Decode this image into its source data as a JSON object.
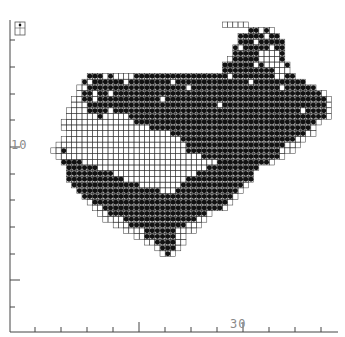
{
  "map": {
    "title": "",
    "type": "tetrad distribution map",
    "colors": {
      "background": "#ffffff",
      "grid": "#333333",
      "dot": "#111111",
      "axis": "#444444",
      "label": "#8a8a8a"
    },
    "cell_size": 5.2,
    "origin": {
      "x": 30,
      "y": 27
    },
    "axis": {
      "y_label": "10",
      "x_label": "30",
      "y_ticks_px": [
        40,
        67,
        94,
        120,
        147,
        174,
        200,
        227,
        254,
        280,
        307
      ],
      "x_ticks_px": [
        35,
        61,
        87,
        113,
        139,
        165,
        191,
        217,
        243,
        269,
        295,
        321
      ]
    },
    "legend_key_label": "",
    "regions_note": "Filled dots = recorded tetrads; open squares = surveyed, not recorded"
  },
  "grid_rows": [
    {
      "row": 0,
      "start": 47,
      "end": 51,
      "dots": "ooooo"
    },
    {
      "row": 1,
      "start": 52,
      "end": 56,
      "dots": "xxoxo"
    },
    {
      "row": 2,
      "start": 50,
      "end": 57,
      "dots": "xxxxxoxx"
    },
    {
      "row": 3,
      "start": 50,
      "end": 58,
      "dots": "xxxoxxxxx"
    },
    {
      "row": 4,
      "start": 49,
      "end": 58,
      "dots": "xoxxxxxoxx"
    },
    {
      "row": 5,
      "start": 49,
      "end": 58,
      "dots": "xxxxxoooox"
    },
    {
      "row": 6,
      "start": 48,
      "end": 58,
      "dots": "oxxxxxoooox"
    },
    {
      "row": 7,
      "start": 47,
      "end": 59,
      "dots": "xxxxxxoxoooox"
    },
    {
      "row": 8,
      "start": 47,
      "end": 59,
      "dots": "xxxxxxxxxxooo"
    },
    {
      "row": 9,
      "start": 21,
      "end": 60,
      "dots": "xxxoxooooxxxxxxxxxxxxxxxxxxoxxxxxxxxooxx"
    },
    {
      "row": 10,
      "start": 20,
      "end": 62,
      "dots": "xoxxxxxxoxxxxxxxxoxxxxxxxxxxxxxxoxxxxxxxxxx"
    },
    {
      "row": 11,
      "start": 19,
      "end": 64,
      "dots": "ooxxxxxxxxxxxxxxxxxxxoxxxxxxxxxxxxxxxxxoxxxxxx"
    },
    {
      "row": 12,
      "start": 19,
      "end": 66,
      "dots": "oxxoxxoxxxxxxxxxxxxxxxxxxxxxxxxxxxxxxxxxxxxxxxxo"
    },
    {
      "row": 13,
      "start": 18,
      "end": 67,
      "dots": "ooxxoxxxxxxxxxxxxoxxxxxxxxxxxxxxxxxxxxxxxxxxxxxxxo"
    },
    {
      "row": 14,
      "start": 18,
      "end": 67,
      "dots": "oooxxxxxxxxxxxxxxxxxxxxxxxxxoxxxxxxxxxxxxxxxxxxxxo"
    },
    {
      "row": 15,
      "start": 17,
      "end": 67,
      "dots": "ooooxxxxoxxxxxxxxxxxxxxxxxxxxxxxxxxxxxxxxxxxxoxxxxo"
    },
    {
      "row": 16,
      "start": 17,
      "end": 67,
      "dots": "ooooooxoooooxxxxxxxxxxxxxxxxxxxxxxxxxxxxxxxxxxxxxxo"
    },
    {
      "row": 17,
      "start": 16,
      "end": 66,
      "dots": "ooooooooooooooxxxxxxxxxxxxxxxxxxxxxxxxxxxxxxxxxxxo"
    },
    {
      "row": 18,
      "start": 16,
      "end": 65,
      "dots": "oooooooooooooooooxxxxxxxxxxxxxxxxxxxxxxxxxxxxxxxo"
    },
    {
      "row": 19,
      "start": 17,
      "end": 63,
      "dots": "ooooooooooooooooooooxxxxxxxxxxxxxxxxxxxxxxxxxxoo"
    },
    {
      "row": 20,
      "start": 16,
      "end": 62,
      "dots": "oooooooooooooooooooooooxxxxxxxxxxxxxxxxxxxxxxoo"
    },
    {
      "row": 21,
      "start": 15,
      "end": 61,
      "dots": "oooooooooooooooooooooooooxxxxxxxxxxxxxxxxxxxooo"
    },
    {
      "row": 22,
      "start": 14,
      "end": 60,
      "dots": "ooxoooooooooooooooooooooooxxxxxxxxxxxxxxxxxxooo"
    },
    {
      "row": 23,
      "start": 15,
      "end": 57,
      "dots": "ooooooooooooooooooooooooooooxxxxxxxxxxxxxxxo"
    },
    {
      "row": 24,
      "start": 16,
      "end": 55,
      "dots": "xxxxooooooooooooooooooooooooooxxxxxxxxxxo"
    },
    {
      "row": 25,
      "start": 17,
      "end": 53,
      "dots": "xxxxxxoooooooooooooooooooooxxxxxxxxxx"
    },
    {
      "row": 26,
      "start": 17,
      "end": 52,
      "dots": "xxxxxxxxxooooooooooooooooxxxxxxxxxxx"
    },
    {
      "row": 27,
      "start": 17,
      "end": 52,
      "dots": "xxxxxxxxxxxooooooooooooxxxxxxxxxxxxx"
    },
    {
      "row": 28,
      "start": 18,
      "end": 51,
      "dots": "xxxxxxxxxxxxxooooooooxxxxxxxxxxxxo"
    },
    {
      "row": 29,
      "start": 19,
      "end": 50,
      "dots": "xxxxxxxxxxxxxxxxoooxxxxxxxxxxxxo"
    },
    {
      "row": 30,
      "start": 20,
      "end": 49,
      "dots": "xxxxxxxxxxxxxxxxxxxxxxxxxxxxxo"
    },
    {
      "row": 31,
      "start": 21,
      "end": 48,
      "dots": "oxxxxxxxxxxxxxxxxxxxxxxxxxxo"
    },
    {
      "row": 32,
      "start": 22,
      "end": 47,
      "dots": "ooxxxxxxxxxxxxxxxxxxxxxxxo"
    },
    {
      "row": 33,
      "start": 23,
      "end": 45,
      "dots": "ooxxxxxxxxxxxxxxxxxxxo"
    },
    {
      "row": 34,
      "start": 24,
      "end": 44,
      "dots": "ooooxxxxxxxxxxxxxxoo"
    },
    {
      "row": 35,
      "start": 26,
      "end": 43,
      "dots": "oooxxxxxxxxxxxooo"
    },
    {
      "row": 36,
      "start": 28,
      "end": 42,
      "dots": "ooooxxxxxxoooo"
    },
    {
      "row": 37,
      "start": 30,
      "end": 41,
      "dots": "ooxxxxxxoo"
    },
    {
      "row": 38,
      "start": 32,
      "end": 40,
      "dots": "ooxxxxoo"
    },
    {
      "row": 39,
      "start": 34,
      "end": 39,
      "dots": "oxxxo"
    },
    {
      "row": 40,
      "start": 35,
      "end": 38,
      "dots": "oxo"
    }
  ]
}
